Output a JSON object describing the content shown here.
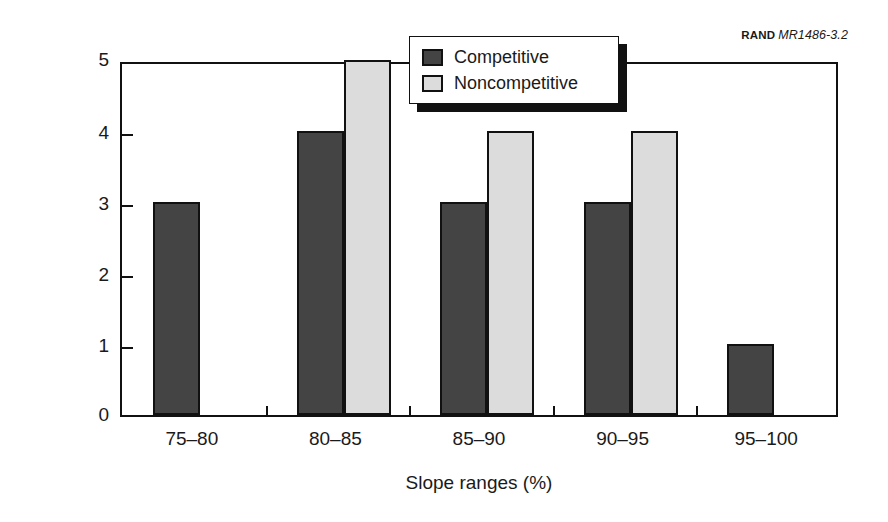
{
  "credit": {
    "organization": "RAND",
    "document_number": "MR1486-3.2"
  },
  "chart_data": {
    "type": "bar",
    "title": "",
    "subtitle": "",
    "xlabel": "Slope ranges (%)",
    "ylabel": "Number of observations",
    "categories": [
      "75–80",
      "80–85",
      "85–90",
      "90–95",
      "95–100"
    ],
    "series": [
      {
        "name": "Competitive",
        "color": "#444444",
        "values": [
          3,
          4,
          3,
          3,
          1
        ]
      },
      {
        "name": "Noncompetitive",
        "color": "#dcdcdc",
        "values": [
          0,
          5,
          4,
          4,
          0
        ]
      }
    ],
    "ylim": [
      0,
      5
    ],
    "yticks": [
      0,
      1,
      2,
      3,
      4,
      5
    ],
    "ytick_labels": [
      "0",
      "1",
      "2",
      "3",
      "4",
      "5"
    ],
    "grid": false,
    "legend_position": "top-center",
    "bar_border_color": "#111111",
    "frame_color": "#111111",
    "background": "#ffffff"
  },
  "legend": {
    "entries": [
      {
        "label": "Competitive",
        "color": "#444444"
      },
      {
        "label": "Noncompetitive",
        "color": "#dcdcdc"
      }
    ]
  }
}
